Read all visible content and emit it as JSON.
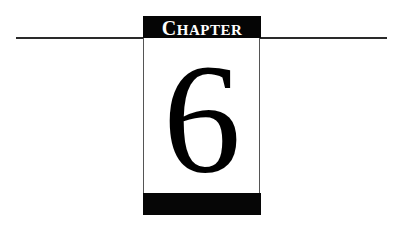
{
  "chapter": {
    "label_first": "C",
    "label_rest": "HAPTER",
    "number": "6"
  },
  "colors": {
    "header_bg": "#050505",
    "header_text": "#ffffff",
    "rule": "#2a2a2a"
  }
}
